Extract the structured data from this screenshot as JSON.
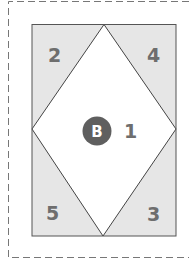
{
  "diagram": {
    "type": "quilt-block-diagram",
    "colors": {
      "frame": "#777777",
      "outline": "#555555",
      "corner_fill": "#e6e6e6",
      "center_fill": "#ffffff",
      "label": "#6e6e6e",
      "badge_fill": "#5f5f5f",
      "badge_text": "#ffffff"
    },
    "pieces": [
      {
        "id": "center",
        "label": "1",
        "position": "center-diamond"
      },
      {
        "id": "top-left",
        "label": "2",
        "position": "top-left-triangle"
      },
      {
        "id": "bottom-right",
        "label": "3",
        "position": "bottom-right-triangle"
      },
      {
        "id": "top-right",
        "label": "4",
        "position": "top-right-triangle"
      },
      {
        "id": "bottom-left",
        "label": "5",
        "position": "bottom-left-triangle"
      }
    ],
    "badge": {
      "label": "B"
    }
  }
}
